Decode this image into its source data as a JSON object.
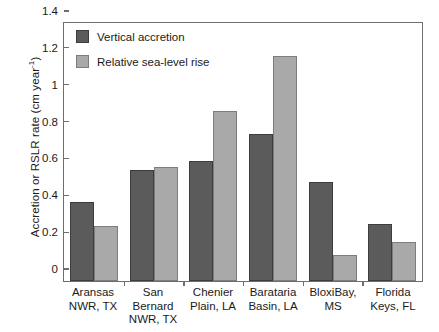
{
  "chart_data": {
    "type": "bar",
    "title": "",
    "xlabel": "",
    "ylabel": "Accretion or RSLR rate (cm year",
    "ylabel_exponent": "-1",
    "ylabel_suffix": ")",
    "ylim": [
      0,
      1.4
    ],
    "yticks": [
      "0",
      "0.2",
      "0.4",
      "0.6",
      "0.8",
      "1",
      "1.2",
      "1.4"
    ],
    "ytick_values": [
      0,
      0.2,
      0.4,
      0.6,
      0.8,
      1.0,
      1.2,
      1.4
    ],
    "grid": false,
    "legend_position": "top-left",
    "categories": [
      "Aransas\nNWR, TX",
      "San\nBernard\nNWR, TX",
      "Chenier\nPlain, LA",
      "Barataria\nBasin, LA",
      "BloxiBay,\nMS",
      "Florida\nKeys, FL"
    ],
    "category_lines": [
      [
        "Aransas",
        "NWR, TX"
      ],
      [
        "San",
        "Bernard",
        "NWR, TX"
      ],
      [
        "Chenier",
        "Plain, LA"
      ],
      [
        "Barataria",
        "Basin, LA"
      ],
      [
        "BloxiBay,",
        "MS"
      ],
      [
        "Florida",
        "Keys, FL"
      ]
    ],
    "series": [
      {
        "name": "Vertical accretion",
        "color": "#5b5b5b",
        "values": [
          0.43,
          0.6,
          0.65,
          0.8,
          0.54,
          0.31
        ]
      },
      {
        "name": "Relative sea-level rise",
        "color": "#a9a9a9",
        "values": [
          0.3,
          0.62,
          0.92,
          1.22,
          0.14,
          0.21
        ]
      }
    ]
  },
  "legend": {
    "items": [
      {
        "label": "Vertical accretion",
        "color": "#5b5b5b"
      },
      {
        "label": "Relative sea-level rise",
        "color": "#a9a9a9"
      }
    ]
  }
}
